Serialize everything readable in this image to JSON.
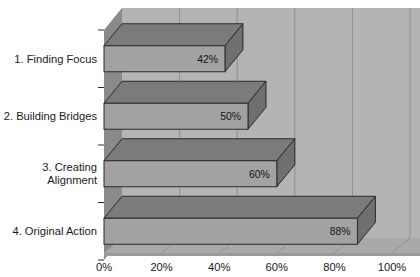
{
  "chart_data": {
    "type": "bar",
    "orientation": "horizontal",
    "style": "3d",
    "title": "",
    "subtitle": "",
    "xlabel": "",
    "ylabel": "",
    "categories": [
      "1. Finding Focus",
      "2. Building Bridges",
      "3. Creating Alignment",
      "4. Original Action"
    ],
    "category_lines": [
      [
        "1. Finding Focus"
      ],
      [
        "2. Building Bridges"
      ],
      [
        "3. Creating",
        "Alignment"
      ],
      [
        "4. Original Action"
      ]
    ],
    "values": [
      42,
      50,
      60,
      88
    ],
    "value_labels": [
      "42%",
      "50%",
      "60%",
      "88%"
    ],
    "xlim": [
      0,
      100
    ],
    "xticks": [
      0,
      20,
      40,
      60,
      80,
      100
    ],
    "xtick_labels": [
      "0%",
      "20%",
      "40%",
      "60%",
      "80%",
      "100%"
    ],
    "grid": true,
    "grid_axis": "x",
    "legend": false,
    "legend_position": "none",
    "units": "percent"
  },
  "colors": {
    "page_background": "#ffffff",
    "wall_back": "#b4b4b4",
    "wall_side": "#8a8a8a",
    "floor_top": "#a9a9a9",
    "floor_front": "#9a9a9a",
    "bar_front": "#a2a2a2",
    "bar_top": "#7b7b7b",
    "bar_end": "#6f6f6f",
    "outline": "#2b2b2b",
    "gridline": "#8f8f8f",
    "text": "#1a1a1a"
  }
}
